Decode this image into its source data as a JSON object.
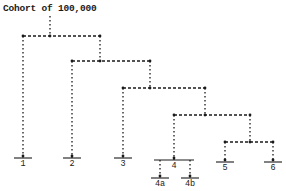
{
  "title": "Cohort of 100,000",
  "colors": {
    "ink": "#1a1a1a",
    "background": "#ffffff"
  },
  "tree": {
    "root": {
      "x": 50,
      "y_top": 16,
      "y_bar": 36
    },
    "splits": [
      {
        "y": 36,
        "left_x": 23,
        "mid_x": 50,
        "right_x": 100
      },
      {
        "y": 61,
        "left_x": 72,
        "mid_x": 100,
        "right_x": 150
      },
      {
        "y": 88,
        "left_x": 123,
        "mid_x": 150,
        "right_x": 205
      },
      {
        "y": 115,
        "left_x": 174,
        "mid_x": 205,
        "right_x": 250
      },
      {
        "y": 142,
        "left_x": 225,
        "mid_x": 250,
        "right_x": 273
      }
    ],
    "leaves": [
      {
        "id": "1",
        "label": "1",
        "x": 23,
        "from_y": 36,
        "bar_y": 158,
        "half": 9
      },
      {
        "id": "2",
        "label": "2",
        "x": 72,
        "from_y": 61,
        "bar_y": 158,
        "half": 9
      },
      {
        "id": "3",
        "label": "3",
        "x": 123,
        "from_y": 88,
        "bar_y": 158,
        "half": 9
      },
      {
        "id": "4",
        "label": "4",
        "x": 174,
        "from_y": 115,
        "bar_y": 160,
        "half": 20
      },
      {
        "id": "5",
        "label": "5",
        "x": 225,
        "from_y": 142,
        "bar_y": 162,
        "half": 9
      },
      {
        "id": "6",
        "label": "6",
        "x": 273,
        "from_y": 142,
        "bar_y": 162,
        "half": 9
      }
    ],
    "subleaves": [
      {
        "id": "4a",
        "label": "4a",
        "x": 160,
        "from_y": 160,
        "bar_y": 178,
        "half": 9
      },
      {
        "id": "4b",
        "label": "4b",
        "x": 190,
        "from_y": 160,
        "bar_y": 178,
        "half": 9
      }
    ]
  }
}
